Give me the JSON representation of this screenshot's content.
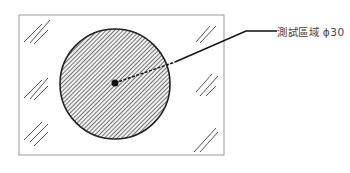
{
  "diagram": {
    "title": "",
    "label": "測試區域 ϕ30",
    "nodes": [
      {
        "id": "sample-plate",
        "shape": "rectangle"
      },
      {
        "id": "test-area",
        "shape": "circle",
        "fill": "hatched",
        "label": "測試區域 ϕ30"
      },
      {
        "id": "center-point",
        "shape": "dot"
      }
    ],
    "edges": [
      {
        "from": "center-point",
        "to": "label",
        "style": "dashed-then-solid leader line"
      }
    ],
    "colors": {
      "hatch": "#555555",
      "outline": "#222222",
      "frame": "#999999"
    }
  }
}
